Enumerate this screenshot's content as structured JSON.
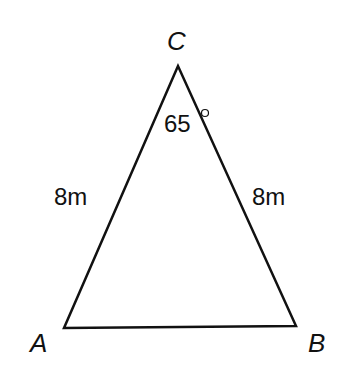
{
  "diagram": {
    "type": "isosceles-triangle",
    "vertices": {
      "A": {
        "label": "A"
      },
      "B": {
        "label": "B"
      },
      "C": {
        "label": "C"
      }
    },
    "sides": {
      "CA": {
        "label": "8m"
      },
      "CB": {
        "label": "8m"
      }
    },
    "angle_C": {
      "value": "65",
      "unit": "°"
    },
    "colors": {
      "stroke": "#111111",
      "background": "#ffffff"
    }
  }
}
